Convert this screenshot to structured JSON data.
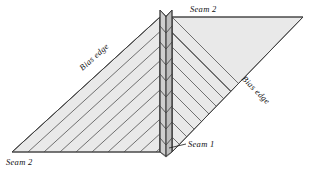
{
  "figure": {
    "background_color": "#ffffff",
    "panel_fill": "#e9e9e9",
    "panel_stroke": "#3d3d3d",
    "stripe_color": "#5a5a5a",
    "spine_fill_left": "#cfcfcf",
    "spine_fill_right": "#bdbdbd",
    "spine_stroke": "#3d3d3d",
    "leader_color": "#1a1a1a",
    "label_color": "#111111"
  },
  "labels": {
    "seam_top": "Seam 2",
    "seam_bottom_left": "Seam 2",
    "seam_center": "Seam 1",
    "bias_edge_left": "Bias edge",
    "bias_edge_right": "Bias edge"
  },
  "geometry": {
    "left_panel_points": "160,17 12,152 160,152 160,17",
    "right_panel_points": "172,17 303,17 172,152 172,17",
    "spine": {
      "left_x": 160,
      "right_x": 172,
      "top_y": 10,
      "bottom_y": 156,
      "chevron_count": 9
    },
    "left_stripe_count": 9,
    "right_stripe_count": 9,
    "bias_angle_left_deg": -42,
    "bias_angle_right_deg": 45
  }
}
